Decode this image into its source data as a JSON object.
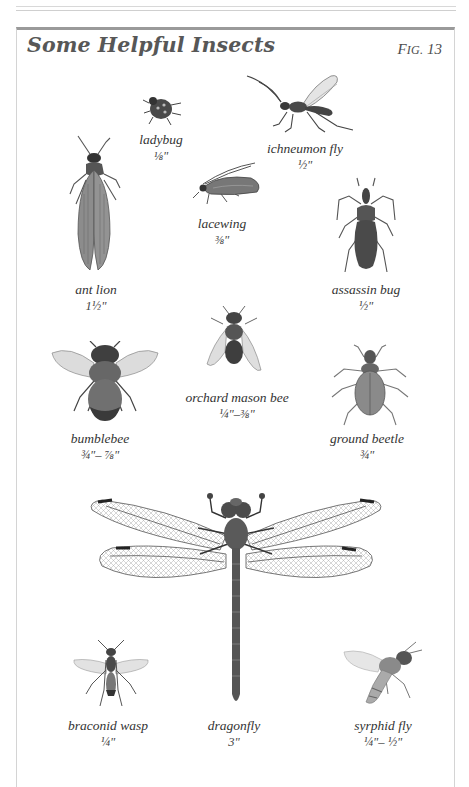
{
  "page": {
    "title": "Some Helpful Insects",
    "figure": {
      "prefix": "F",
      "small_caps": "IG.",
      "number": "13"
    }
  },
  "insects": [
    {
      "id": "ladybug",
      "name": "ladybug",
      "size": "⅛\""
    },
    {
      "id": "ichneumon-fly",
      "name": "ichneumon fly",
      "size": "½\""
    },
    {
      "id": "lacewing",
      "name": "lacewing",
      "size": "⅜\""
    },
    {
      "id": "ant-lion",
      "name": "ant lion",
      "size": "1½\""
    },
    {
      "id": "assassin-bug",
      "name": "assassin bug",
      "size": "½\""
    },
    {
      "id": "orchard-mason-bee",
      "name": "orchard mason bee",
      "size": "¼\"–⅜\""
    },
    {
      "id": "bumblebee",
      "name": "bumblebee",
      "size": "¾\"– ⅞\""
    },
    {
      "id": "ground-beetle",
      "name": "ground beetle",
      "size": "¾\""
    },
    {
      "id": "braconid-wasp",
      "name": "braconid wasp",
      "size": "¼\""
    },
    {
      "id": "dragonfly",
      "name": "dragonfly",
      "size": "3\""
    },
    {
      "id": "syrphid-fly",
      "name": "syrphid fly",
      "size": "¼\"– ½\""
    }
  ],
  "colors": {
    "ink": "#333333",
    "title": "#575757",
    "frame_top": "#9a9a9a",
    "illustration": "#6b6b6b"
  }
}
